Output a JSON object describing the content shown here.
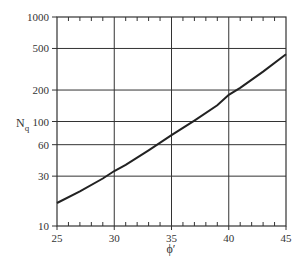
{
  "chart_data": {
    "type": "line",
    "title": "",
    "xlabel": "ϕ′",
    "ylabel": "N",
    "ylabel_subscript": "q",
    "xlim": [
      25,
      45
    ],
    "ylim": [
      10,
      1000
    ],
    "yscale": "log",
    "grid": true,
    "x_ticks": [
      25,
      30,
      35,
      40,
      45
    ],
    "x_tick_labels": [
      "25",
      "30",
      "35",
      "40",
      "45"
    ],
    "x_minor_step": 1,
    "y_ticks": [
      10,
      30,
      60,
      100,
      200,
      500,
      1000
    ],
    "y_tick_labels": [
      "10",
      "30",
      "60",
      "100",
      "200",
      "500",
      "1000"
    ],
    "legend": null,
    "series": [
      {
        "name": "Nq",
        "color": "#222222",
        "x": [
          25,
          27,
          29,
          30,
          31,
          33,
          35,
          37,
          39,
          40,
          41,
          43,
          45
        ],
        "values": [
          16.6,
          21.5,
          28.5,
          33.6,
          38.5,
          53,
          74,
          102,
          143,
          180,
          210,
          300,
          440
        ]
      }
    ]
  },
  "plot": {
    "left": 57,
    "right": 286,
    "top": 17,
    "bottom": 226
  },
  "colors": {
    "axis": "#333333",
    "grid": "#333333",
    "curve": "#222222"
  }
}
